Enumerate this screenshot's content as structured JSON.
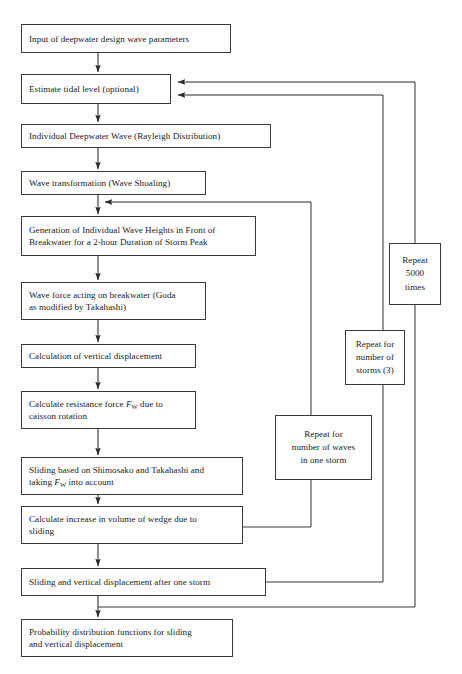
{
  "diagram": {
    "type": "flowchart",
    "stroke_color": "#3a3a3a",
    "background_color": "#ffffff"
  },
  "nodes": {
    "input_deepwater": {
      "label": "Input of deepwater design wave parameters",
      "x": 21,
      "y": 24,
      "w": 210,
      "h": 29
    },
    "estimate_tidal": {
      "label": "Estimate tidal level (optional)",
      "x": 21,
      "y": 74,
      "w": 150,
      "h": 30
    },
    "individual_deepwater": {
      "label": "Individual Deepwater Wave (Rayleigh Distribution)",
      "x": 21,
      "y": 124,
      "w": 250,
      "h": 24
    },
    "wave_transformation": {
      "label": "Wave transformation (Wave Shoaling)",
      "x": 21,
      "y": 171,
      "w": 185,
      "h": 24
    },
    "generation_heights": {
      "label": "Generation of Individual Wave Heights in Front of\nBreakwater for a 2-hour Duration of Storm Peak",
      "x": 21,
      "y": 216,
      "w": 235,
      "h": 40
    },
    "wave_force": {
      "label": "Wave force acting on breakwater (Goda\nas modified by Takahashi)",
      "x": 21,
      "y": 282,
      "w": 185,
      "h": 38
    },
    "calc_vertical_disp": {
      "label": "Calculation of vertical displacement",
      "x": 21,
      "y": 344,
      "w": 175,
      "h": 24
    },
    "calc_resistance": {
      "label_prefix": "Calculate resistance force ",
      "label_symbol": "F",
      "label_subscript": "W",
      "label_suffix": " due to\ncaisson rotation",
      "x": 21,
      "y": 391,
      "w": 175,
      "h": 38
    },
    "sliding_shimosako": {
      "label_prefix": "Sliding based on Shimosako and Takahashi and\ntaking ",
      "label_symbol": "F",
      "label_subscript": "W",
      "label_suffix": " into account",
      "x": 21,
      "y": 457,
      "w": 222,
      "h": 38
    },
    "calc_increase_volume": {
      "label": "Calculate increase in volume of wedge due to\nsliding",
      "x": 21,
      "y": 506,
      "w": 222,
      "h": 38
    },
    "sliding_after_storm": {
      "label": "Sliding and vertical displacement after one storm",
      "x": 21,
      "y": 568,
      "w": 245,
      "h": 28
    },
    "probability_functions": {
      "label": "Probability distribution functions for sliding\nand vertical displacement",
      "x": 21,
      "y": 619,
      "w": 212,
      "h": 38
    }
  },
  "loop_boxes": {
    "repeat_waves": {
      "label": "Repeat for\nnumber of waves\nin one storm",
      "x": 275,
      "y": 415,
      "w": 97,
      "h": 65
    },
    "repeat_storms": {
      "label": "Repeat for\nnumber of\nstorms (3)",
      "x": 345,
      "y": 330,
      "w": 60,
      "h": 55
    },
    "repeat_5000": {
      "label": "Repeat\n5000\ntimes",
      "x": 389,
      "y": 243,
      "w": 52,
      "h": 62
    }
  },
  "edges": {
    "main_flow": [
      {
        "from": "input_deepwater",
        "to": "estimate_tidal"
      },
      {
        "from": "estimate_tidal",
        "to": "individual_deepwater"
      },
      {
        "from": "individual_deepwater",
        "to": "wave_transformation"
      },
      {
        "from": "wave_transformation",
        "to": "generation_heights"
      },
      {
        "from": "generation_heights",
        "to": "wave_force"
      },
      {
        "from": "wave_force",
        "to": "calc_vertical_disp"
      },
      {
        "from": "calc_vertical_disp",
        "to": "calc_resistance"
      },
      {
        "from": "calc_resistance",
        "to": "sliding_shimosako"
      },
      {
        "from": "sliding_shimosako",
        "to": "calc_increase_volume"
      },
      {
        "from": "calc_increase_volume",
        "to": "sliding_after_storm"
      },
      {
        "from": "sliding_after_storm",
        "to": "probability_functions"
      }
    ],
    "feedback_loops": [
      {
        "name": "wave-loop",
        "label": "Repeat for number of waves in one storm",
        "from": "calc_increase_volume",
        "to": "wave_transformation",
        "riser_x": 311,
        "exit_y": 527,
        "entry_y": 202
      },
      {
        "name": "storm-loop",
        "label": "Repeat for number of storms (3)",
        "from": "sliding_after_storm",
        "to": "estimate_tidal",
        "riser_x": 383,
        "exit_y": 582,
        "entry_y": 95
      },
      {
        "name": "simulation-loop",
        "label": "Repeat 5000 times",
        "from": "probability_functions",
        "to": "estimate_tidal",
        "riser_x": 415,
        "exit_y": 607,
        "entry_y": 82
      }
    ]
  }
}
